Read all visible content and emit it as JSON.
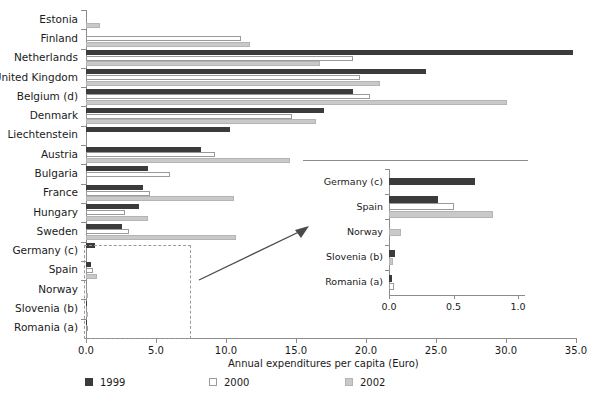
{
  "chart_data": {
    "type": "bar",
    "orientation": "horizontal",
    "title": "",
    "xlabel": "Annual expenditures per capita (Euro)",
    "ylabel": "",
    "xlim": [
      0.0,
      35.0
    ],
    "xticks": [
      "0.0",
      "5.0",
      "10.0",
      "15.0",
      "20.0",
      "25.0",
      "30.0",
      "35.0"
    ],
    "grid": false,
    "legend_position": "bottom",
    "categories": [
      "Estonia",
      "Finland",
      "Netherlands",
      "United Kingdom",
      "Belgium (d)",
      "Denmark",
      "Liechtenstein",
      "Austria",
      "Bulgaria",
      "France",
      "Hungary",
      "Sweden",
      "Germany (c)",
      "Spain",
      "Norway",
      "Slovenia (b)",
      "Romania (a)"
    ],
    "series": [
      {
        "name": "1999",
        "color": "#3b3b3b",
        "values": [
          null,
          null,
          34.8,
          24.3,
          19.1,
          17.0,
          10.3,
          8.2,
          4.4,
          4.1,
          3.8,
          2.6,
          0.67,
          0.38,
          null,
          0.05,
          0.02
        ]
      },
      {
        "name": "2000",
        "color": "#ffffff",
        "values": [
          null,
          11.1,
          19.1,
          19.6,
          20.3,
          14.7,
          null,
          9.2,
          6.0,
          4.6,
          2.8,
          3.1,
          null,
          0.5,
          null,
          null,
          0.04
        ]
      },
      {
        "name": "2002",
        "color": "#c9c9c9",
        "values": [
          1.0,
          11.7,
          16.7,
          21.0,
          30.1,
          16.4,
          null,
          14.6,
          null,
          10.6,
          4.4,
          10.7,
          null,
          0.81,
          0.09,
          0.03,
          null
        ]
      }
    ]
  },
  "inset_chart": {
    "type": "bar",
    "orientation": "horizontal",
    "xlim": [
      0.0,
      1.0
    ],
    "xticks": [
      "0.0",
      "0.5",
      "1.0"
    ],
    "categories": [
      "Germany (c)",
      "Spain",
      "Norway",
      "Slovenia (b)",
      "Romania (a)"
    ],
    "series": [
      {
        "name": "1999",
        "color": "#3b3b3b",
        "values": [
          0.67,
          0.38,
          null,
          0.05,
          0.02
        ]
      },
      {
        "name": "2000",
        "color": "#ffffff",
        "values": [
          null,
          0.5,
          null,
          null,
          0.04
        ]
      },
      {
        "name": "2002",
        "color": "#c9c9c9",
        "values": [
          null,
          0.81,
          0.09,
          0.03,
          null
        ]
      }
    ]
  },
  "legend": {
    "items": [
      {
        "label": "1999",
        "color": "#3b3b3b",
        "style": "filled-dark"
      },
      {
        "label": "2000",
        "color": "#ffffff",
        "style": "outlined-white"
      },
      {
        "label": "2002",
        "color": "#c9c9c9",
        "style": "filled-light"
      }
    ]
  },
  "axis": {
    "x_title": "Annual expenditures per capita (Euro)"
  }
}
